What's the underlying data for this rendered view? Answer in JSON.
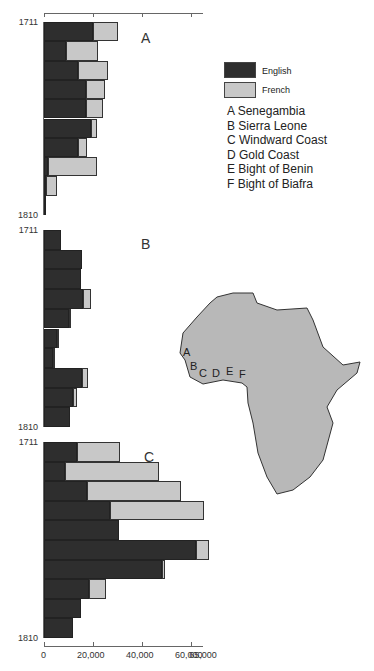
{
  "chart_data": [
    {
      "type": "bar",
      "orientation": "horizontal",
      "stacked": true,
      "title": "A",
      "region": "Senegambia",
      "categories": [
        "1711",
        "1721",
        "1731",
        "1741",
        "1751",
        "1761",
        "1771",
        "1781",
        "1791",
        "1801"
      ],
      "series": [
        {
          "name": "English",
          "values": [
            20000,
            9000,
            14000,
            17000,
            17000,
            19000,
            14000,
            1500,
            1000,
            1000
          ]
        },
        {
          "name": "French",
          "values": [
            10000,
            13000,
            12000,
            8000,
            7000,
            2500,
            3500,
            20000,
            4500,
            0
          ]
        }
      ],
      "ylabel_top": "1711",
      "ylabel_bottom": "1810",
      "xlim": [
        0,
        65000
      ]
    },
    {
      "type": "bar",
      "orientation": "horizontal",
      "stacked": true,
      "title": "B",
      "region": "Sierra Leone",
      "categories": [
        "1711",
        "1721",
        "1731",
        "1741",
        "1751",
        "1761",
        "1771",
        "1781",
        "1791",
        "1801"
      ],
      "series": [
        {
          "name": "English",
          "values": [
            7000,
            15500,
            15000,
            16000,
            10000,
            5300,
            3700,
            15500,
            12000,
            10500
          ]
        },
        {
          "name": "French",
          "values": [
            0,
            0,
            0,
            3000,
            1000,
            800,
            800,
            2500,
            1500,
            0
          ]
        }
      ],
      "ylabel_top": "1711",
      "ylabel_bottom": "1810",
      "xlim": [
        0,
        65000
      ]
    },
    {
      "type": "bar",
      "orientation": "horizontal",
      "stacked": true,
      "title": "C",
      "region": "Windward Coast",
      "categories": [
        "1711",
        "1721",
        "1731",
        "1741",
        "1751",
        "1761",
        "1771",
        "1781",
        "1791",
        "1801"
      ],
      "series": [
        {
          "name": "English",
          "values": [
            13500,
            8500,
            17500,
            27000,
            30500,
            62000,
            48000,
            18500,
            15000,
            12000
          ]
        },
        {
          "name": "French",
          "values": [
            17500,
            38500,
            38500,
            38500,
            0,
            5500,
            1500,
            7000,
            0,
            0
          ]
        }
      ],
      "ylabel_top": "1711",
      "ylabel_bottom": "1810",
      "xlabel_ticks": [
        "0",
        "20,000",
        "40,000",
        "60,000",
        "65,000"
      ],
      "xlim": [
        0,
        65000
      ]
    }
  ],
  "axis": {
    "max": 65000,
    "ticks": [
      {
        "value": 0,
        "label": "0"
      },
      {
        "value": 20000,
        "label": "20,000"
      },
      {
        "value": 40000,
        "label": "40,000"
      },
      {
        "value": 60000,
        "label": "60,000"
      },
      {
        "value": 65000,
        "label": "65,000"
      }
    ]
  },
  "legend": {
    "english": {
      "label": "English",
      "color": "#2e2e2e"
    },
    "french": {
      "label": "French",
      "color": "#c8c8c8"
    }
  },
  "regions": [
    {
      "letter": "A",
      "name": "Senegambia"
    },
    {
      "letter": "B",
      "name": "Sierra Leone"
    },
    {
      "letter": "C",
      "name": "Windward Coast"
    },
    {
      "letter": "D",
      "name": "Gold Coast"
    },
    {
      "letter": "E",
      "name": "Bight of Benin"
    },
    {
      "letter": "F",
      "name": "Bight of Biafra"
    }
  ],
  "map": {
    "fill": "#b8b8b8",
    "letters": [
      "A",
      "B",
      "C",
      "D",
      "E",
      "F"
    ]
  }
}
